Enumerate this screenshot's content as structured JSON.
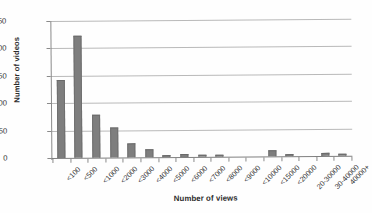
{
  "chart_data": {
    "type": "bar",
    "title": "",
    "subtitle": "",
    "xlabel": "Number of views",
    "ylabel": "Number of videos",
    "categories": [
      "<100",
      "<500",
      "<1000",
      "<2000",
      "<3000",
      "<4000",
      "<5000",
      "<6000",
      "<7000",
      "<8000",
      "<9000",
      "<10000",
      "<15000",
      "<20000",
      "20-30000",
      "30-40000",
      "40000+"
    ],
    "values": [
      142,
      223,
      78,
      54,
      26,
      15,
      3,
      6,
      3,
      1,
      0,
      0,
      11,
      1,
      0,
      5,
      1
    ],
    "ylim": [
      0,
      250
    ],
    "yticks": [
      0,
      50,
      100,
      150,
      200,
      250
    ],
    "ytick_labels": [
      "0",
      "50",
      "100",
      "150",
      "200",
      "250"
    ],
    "grid": "horizontal",
    "legend": "none",
    "series_color": "#7e7e7e",
    "gridline_color": "#b9b9b9",
    "axis_color": "#8a8a8a",
    "bar_count": 17
  }
}
